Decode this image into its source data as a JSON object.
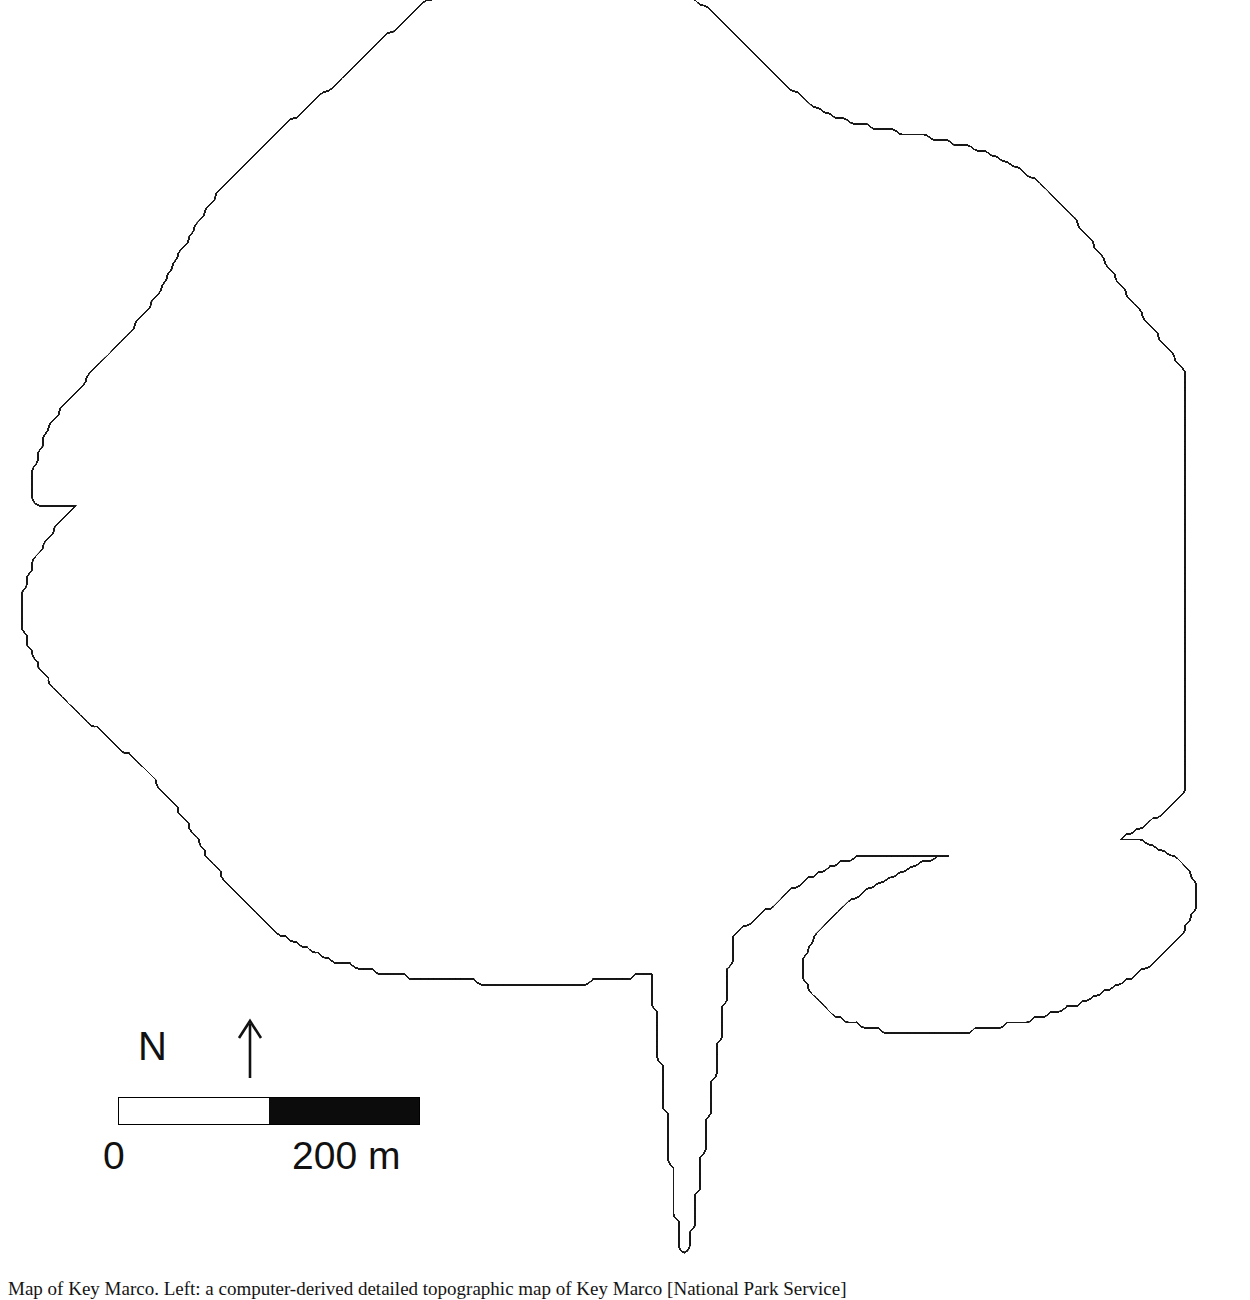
{
  "document": {
    "title": "Detailed topographic map of Key Marco",
    "caption": "Map of Key Marco. Left: a computer-derived detailed topographic map of Key Marco [National Park Service]"
  },
  "legend": {
    "north_label": "N",
    "north_arrow_icon": "north-arrow-icon",
    "scalebar": {
      "min_label": "0",
      "max_label": "200 m",
      "total_length_m": 200,
      "segments": [
        {
          "fill": "white",
          "from_m": 0,
          "to_m": 100
        },
        {
          "fill": "black",
          "from_m": 100,
          "to_m": 200
        }
      ],
      "unit": "m",
      "bar_color": "#0c0c0c",
      "outline_color": "#000000"
    }
  },
  "chart_data": {
    "type": "contour",
    "title": "Detailed topographic map of Key Marco",
    "subtitle": "",
    "xlabel": "",
    "ylabel": "",
    "grid": false,
    "legend_position": "bottom-left",
    "contour_interval_note": "unlabelled closed isolines; interval not annotated on plate",
    "line_color": "#1a1a1a",
    "line_width_px": 1.0,
    "background": "#ffffff",
    "annotations": [
      "Steep bundled contour scarp along eastern margin",
      "Long narrow southern sand spit with parallel isolines",
      "Numerous small closed summit rings across the interior",
      "Smooth outer coastline contours on western margin"
    ],
    "features": [
      {
        "name": "eastern-scarp",
        "kind": "dense-contour-bundle",
        "x_frac": 0.9,
        "y_frac": 0.3
      },
      {
        "name": "southern-spit",
        "kind": "narrow-ridge",
        "x_frac": 0.56,
        "y_frac": 0.88
      },
      {
        "name": "southeast-lobe",
        "kind": "ridge-lobe",
        "x_frac": 0.8,
        "y_frac": 0.76
      },
      {
        "name": "northwest-shore",
        "kind": "smooth-coast",
        "x_frac": 0.1,
        "y_frac": 0.32
      },
      {
        "name": "central-mounds",
        "kind": "closed-summit-cluster",
        "x_frac": 0.55,
        "y_frac": 0.45
      }
    ]
  }
}
